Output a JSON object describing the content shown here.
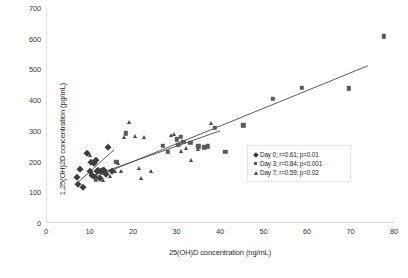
{
  "chart_data": {
    "type": "scatter",
    "title": "",
    "xlabel": "25(OH)D concentration (ng/mL)",
    "ylabel": "1,25(OH)2D concentration (pg/mL)",
    "xlim": [
      0,
      80
    ],
    "ylim": [
      0,
      700
    ],
    "xticks": [
      0,
      10,
      20,
      30,
      40,
      50,
      60,
      70,
      80
    ],
    "yticks": [
      0,
      100,
      200,
      300,
      400,
      500,
      600,
      700
    ],
    "grid": false,
    "legend_position": "right-inside",
    "series": [
      {
        "name": "Day 0; r=0.61; p=0.01",
        "label": "Day 0; r=0.61; p=0.01",
        "marker": "diamond",
        "color": "#3d3d3d",
        "r": 0.61,
        "p": "0.01",
        "points": [
          [
            7.2,
            150
          ],
          [
            7.4,
            128
          ],
          [
            7.8,
            175
          ],
          [
            8.6,
            118
          ],
          [
            9.4,
            228
          ],
          [
            10.0,
            170
          ],
          [
            10.4,
            200
          ],
          [
            10.6,
            155
          ],
          [
            11.0,
            196
          ],
          [
            11.2,
            150
          ],
          [
            11.6,
            205
          ],
          [
            11.8,
            168
          ],
          [
            12.0,
            172
          ],
          [
            12.4,
            145
          ],
          [
            12.6,
            170
          ],
          [
            13.0,
            172
          ],
          [
            13.4,
            172
          ],
          [
            13.8,
            160
          ],
          [
            14.2,
            248
          ],
          [
            15.2,
            170
          ]
        ]
      },
      {
        "name": "Day 3; r=0.84; p<0.001",
        "label": "Day 3; r=0.84; p<0.001",
        "marker": "square",
        "color": "#5a5a5a",
        "r": 0.84,
        "p": "<0.001",
        "points": [
          [
            11.4,
            140
          ],
          [
            16.2,
            200
          ],
          [
            18.4,
            292
          ],
          [
            26.8,
            252
          ],
          [
            28.0,
            232
          ],
          [
            30.0,
            272
          ],
          [
            30.4,
            255
          ],
          [
            31.0,
            280
          ],
          [
            31.6,
            265
          ],
          [
            33.2,
            262
          ],
          [
            35.0,
            250
          ],
          [
            36.4,
            247
          ],
          [
            37.2,
            250
          ],
          [
            38.8,
            310
          ],
          [
            41.2,
            232
          ],
          [
            45.4,
            318
          ],
          [
            52.2,
            405
          ],
          [
            58.8,
            440
          ],
          [
            69.6,
            438
          ],
          [
            77.6,
            608
          ]
        ]
      },
      {
        "name": "Day 7; r=0.59; p=0.02",
        "label": "Day 7; r=0.59; p=0.02",
        "marker": "triangle",
        "color": "#4a4a4a",
        "r": 0.59,
        "p": "0.02",
        "points": [
          [
            10.2,
            222
          ],
          [
            13.0,
            140
          ],
          [
            14.6,
            152
          ],
          [
            15.8,
            170
          ],
          [
            16.6,
            195
          ],
          [
            17.2,
            168
          ],
          [
            18.0,
            280
          ],
          [
            19.0,
            330
          ],
          [
            20.4,
            282
          ],
          [
            21.4,
            178
          ],
          [
            21.8,
            145
          ],
          [
            22.6,
            280
          ],
          [
            24.2,
            170
          ],
          [
            28.8,
            285
          ],
          [
            29.4,
            290
          ],
          [
            31.0,
            235
          ],
          [
            32.2,
            245
          ],
          [
            33.4,
            205
          ],
          [
            35.0,
            240
          ],
          [
            38.0,
            325
          ]
        ]
      }
    ],
    "trend_lines": [
      {
        "name": "day0-trendline",
        "x1": 7.0,
        "y1": 128,
        "x2": 15.6,
        "y2": 238
      },
      {
        "name": "day3-trendline",
        "x1": 11.0,
        "y1": 148,
        "x2": 74.0,
        "y2": 512
      },
      {
        "name": "day7-trendline",
        "x1": 10.0,
        "y1": 150,
        "x2": 40.0,
        "y2": 300
      }
    ]
  }
}
